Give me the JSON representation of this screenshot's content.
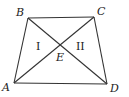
{
  "diagram": {
    "type": "trapezoid-with-diagonals",
    "vertices": {
      "A": {
        "label": "A",
        "x": 14,
        "y": 83
      },
      "B": {
        "label": "B",
        "x": 28,
        "y": 18
      },
      "C": {
        "label": "C",
        "x": 94,
        "y": 17
      },
      "D": {
        "label": "D",
        "x": 107,
        "y": 84
      }
    },
    "intersection": {
      "label": "E",
      "x": 61,
      "y": 44
    },
    "regions": [
      {
        "label": "I",
        "x": 38,
        "y": 49
      },
      {
        "label": "II",
        "x": 80,
        "y": 49
      }
    ],
    "segments": [
      "AB",
      "BC",
      "CD",
      "DA",
      "AC",
      "BD"
    ],
    "colors": {
      "line": "#333333",
      "text": "#222222",
      "background": "#ffffff"
    }
  }
}
